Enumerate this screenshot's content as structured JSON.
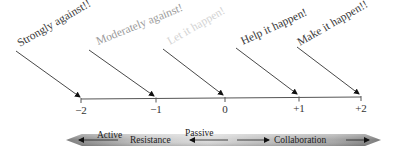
{
  "diagram": {
    "attitudes": [
      {
        "label": "Strongly against!!",
        "value": "−2",
        "color": "#3a3a3a"
      },
      {
        "label": "Moderately against!",
        "value": "−1",
        "color": "#9a9a9a"
      },
      {
        "label": "Let it happen!",
        "value": "0",
        "color": "#d6d6d6"
      },
      {
        "label": "Help it happen!",
        "value": "+1",
        "color": "#3a3a3a"
      },
      {
        "label": "Make it happen!!",
        "value": "+2",
        "color": "#3a3a3a"
      }
    ],
    "spectrum": {
      "active_label": "Active",
      "resistance_label": "Resistance",
      "passive_label": "Passive",
      "collaboration_label": "Collaboration"
    },
    "colors": {
      "line": "#444444",
      "bar_dark": "#8c8c8c",
      "bar_light": "#d4d4d4",
      "text_dark": "#333333"
    }
  }
}
